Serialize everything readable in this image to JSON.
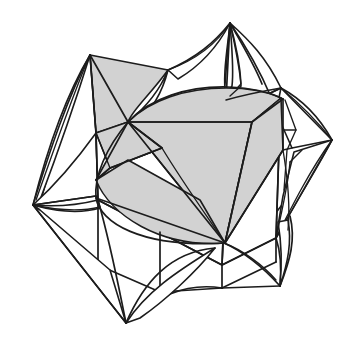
{
  "figure": {
    "canvas": {
      "width": 357,
      "height": 344,
      "background": "#ffffff"
    },
    "style": {
      "line_color": "#1c1c1c",
      "shade_color": "#d2d2d2",
      "white_color": "#ffffff",
      "line_width": 1.7
    },
    "spike_tips": [
      {
        "name": "top",
        "x": 230,
        "y": 23
      },
      {
        "name": "upper-left",
        "x": 90,
        "y": 55
      },
      {
        "name": "left",
        "x": 33,
        "y": 205
      },
      {
        "name": "right",
        "x": 332,
        "y": 140
      },
      {
        "name": "bottom-left",
        "x": 126,
        "y": 323
      },
      {
        "name": "bottom-right",
        "x": 280,
        "y": 286
      }
    ],
    "cube_vertices": [
      {
        "name": "front-top-left",
        "x": 96,
        "y": 133
      },
      {
        "name": "front-top-right",
        "x": 228,
        "y": 113
      },
      {
        "name": "front-bottom-right",
        "x": 222,
        "y": 265
      },
      {
        "name": "front-bottom-left",
        "x": 98,
        "y": 200
      },
      {
        "name": "back-top-right",
        "x": 281,
        "y": 88
      },
      {
        "name": "back-bottom-right",
        "x": 276,
        "y": 238
      },
      {
        "name": "mid-top",
        "x": 128,
        "y": 122
      },
      {
        "name": "mid-bottom",
        "x": 224,
        "y": 243
      }
    ],
    "shaded_facets_count": 8
  }
}
